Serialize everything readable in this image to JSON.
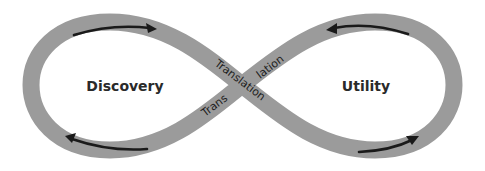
{
  "diagram": {
    "type": "infinity-loop",
    "left_label": "Discovery",
    "right_label": "Utility",
    "crossing_label_upper_part1": "Translation",
    "crossing_label_upper_part2": "lation",
    "crossing_label_lower_part1": "Trans",
    "crossing_label_lower_part2": "lation",
    "flow": [
      {
        "segment": "left-top",
        "direction": "right"
      },
      {
        "segment": "left-bottom",
        "direction": "left"
      },
      {
        "segment": "right-top",
        "direction": "left"
      },
      {
        "segment": "right-bottom",
        "direction": "right"
      }
    ],
    "colors": {
      "band": "#9b9b9b",
      "arrow": "#1a1a1a",
      "text": "#2a2a2a",
      "background": "#ffffff"
    }
  }
}
